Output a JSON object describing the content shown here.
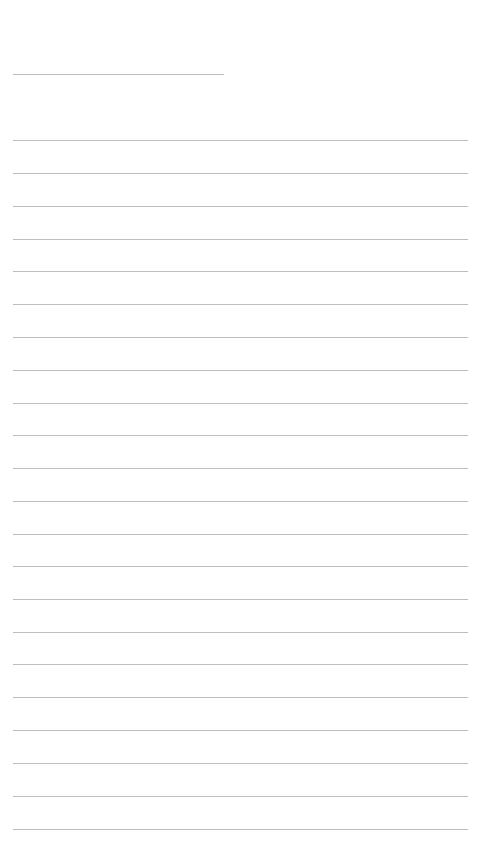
{
  "page": {
    "type": "lined-paper",
    "background": "#ffffff",
    "rule_color": "#bdbdbd",
    "header_rule": {
      "x": 13,
      "y": 74,
      "width": 211
    },
    "lines": {
      "x": 13,
      "width": 455,
      "y_positions": [
        140,
        173,
        206,
        239,
        271,
        304,
        337,
        370,
        403,
        435,
        468,
        501,
        534,
        566,
        599,
        632,
        664,
        697,
        730,
        763,
        796,
        829
      ]
    }
  }
}
